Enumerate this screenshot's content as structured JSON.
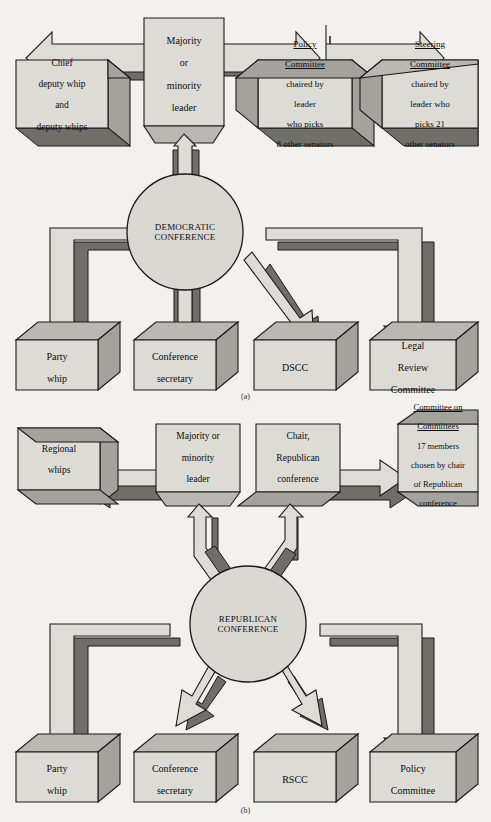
{
  "figure": {
    "panel_a_caption": "(a)",
    "panel_b_caption": "(b)",
    "colors": {
      "background": "#f2f1ee",
      "face": "#d8d7d2",
      "face_light": "#e3e2de",
      "top_face": "#b9b8b2",
      "side_face": "#9d9c96",
      "shadow": "#6e6d68",
      "outline": "#1a1a1a"
    }
  },
  "panel_a": {
    "hub": {
      "name": "democratic-conference",
      "line1": "DEMOCRATIC",
      "line2": "CONFERENCE"
    },
    "leader": {
      "name": "majority-or-minority-leader",
      "lines": [
        "Majority",
        "or",
        "minority",
        "leader"
      ]
    },
    "top_boxes": [
      {
        "name": "chief-deputy-whip-and-deputy-whips",
        "lines": [
          "Chief",
          "deputy whip",
          "and",
          "deputy whips"
        ],
        "underline": []
      },
      {
        "name": "policy-committee",
        "lines": [
          "Policy",
          "Committee",
          "chaired by",
          "leader",
          "who picks",
          "8 other senators"
        ],
        "underline": [
          0,
          1
        ]
      },
      {
        "name": "steering-committee",
        "lines": [
          "Steering",
          "Committee",
          "chaired by",
          "leader who",
          "picks 21",
          "other senators"
        ],
        "underline": [
          0,
          1
        ]
      }
    ],
    "bottom_boxes": [
      {
        "name": "party-whip",
        "lines": [
          "Party",
          "whip"
        ]
      },
      {
        "name": "conference-secretary",
        "lines": [
          "Conference",
          "secretary"
        ]
      },
      {
        "name": "dscc",
        "lines": [
          "DSCC"
        ]
      },
      {
        "name": "legal-review-committee",
        "lines": [
          "Legal",
          "Review",
          "Committee"
        ]
      }
    ]
  },
  "panel_b": {
    "hub": {
      "name": "republican-conference",
      "line1": "REPUBLICAN",
      "line2": "CONFERENCE"
    },
    "top_boxes": [
      {
        "name": "regional-whips",
        "lines": [
          "Regional",
          "whips"
        ],
        "underline": []
      },
      {
        "name": "majority-or-minority-leader",
        "lines": [
          "Majority or",
          "minority",
          "leader"
        ],
        "underline": []
      },
      {
        "name": "chair-republican-conference",
        "lines": [
          "Chair,",
          "Republican",
          "conference"
        ],
        "underline": []
      },
      {
        "name": "committee-on-committees",
        "lines": [
          "Committee on",
          "Committees",
          "17 members",
          "chosen by chair",
          "of Republican",
          "conference"
        ],
        "underline": [
          0,
          1
        ]
      }
    ],
    "bottom_boxes": [
      {
        "name": "party-whip",
        "lines": [
          "Party",
          "whip"
        ]
      },
      {
        "name": "conference-secretary",
        "lines": [
          "Conference",
          "secretary"
        ]
      },
      {
        "name": "rscc",
        "lines": [
          "RSCC"
        ]
      },
      {
        "name": "policy-committee",
        "lines": [
          "Policy",
          "Committee"
        ]
      }
    ]
  }
}
